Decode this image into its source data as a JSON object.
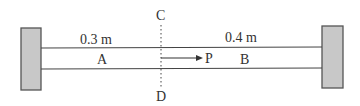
{
  "diagram": {
    "labels": {
      "length_a": "0.3 m",
      "length_b": "0.4 m",
      "segment_a": "A",
      "segment_b": "B",
      "point_c": "C",
      "point_d": "D",
      "point_p": "P"
    },
    "colors": {
      "wall_fill": "#c8c8c8",
      "wall_stroke": "#555555",
      "line": "#444444",
      "text": "#333333"
    }
  }
}
